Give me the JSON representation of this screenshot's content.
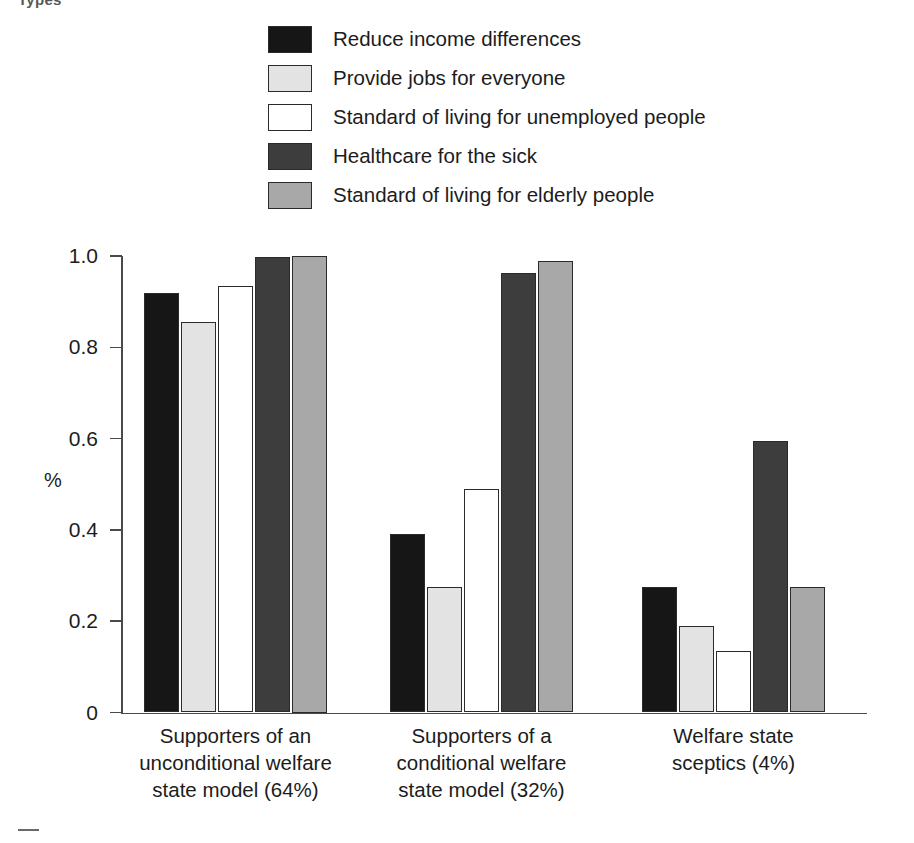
{
  "figure": {
    "top_cropped_text": "Types",
    "y_axis_title": "%",
    "footer_rule": "horizontal-rule"
  },
  "legend": {
    "position": "top-center",
    "items": [
      {
        "label": "Reduce income differences",
        "color": "#161616"
      },
      {
        "label": "Provide jobs for everyone",
        "color": "#e3e3e3"
      },
      {
        "label": "Standard of living for unemployed people",
        "color": "#ffffff"
      },
      {
        "label": "Healthcare for the sick",
        "color": "#3d3d3d"
      },
      {
        "label": "Standard of living for elderly people",
        "color": "#a8a8a8"
      }
    ]
  },
  "chart_data": {
    "type": "bar",
    "title": "",
    "subtitle": "",
    "xlabel": "",
    "ylabel": "%",
    "ylim": [
      0,
      1.0
    ],
    "yticks": [
      "0",
      "0.2",
      "0.4",
      "0.6",
      "0.8",
      "1.0"
    ],
    "ytick_values": [
      0,
      0.2,
      0.4,
      0.6,
      0.8,
      1.0
    ],
    "grid": false,
    "legend_position": "top-center",
    "categories": [
      "Supporters of an unconditional welfare state model (64%)",
      "Supporters of a conditional welfare state model (32%)",
      "Welfare state sceptics (4%)"
    ],
    "category_lines": [
      [
        "Supporters of an",
        "unconditional welfare",
        "state model (64%)"
      ],
      [
        "Supporters of a",
        "conditional welfare",
        "state model (32%)"
      ],
      [
        "Welfare state",
        "sceptics (4%)"
      ]
    ],
    "series": [
      {
        "name": "Reduce income differences",
        "color": "#161616",
        "values": [
          0.92,
          0.39,
          0.275
        ]
      },
      {
        "name": "Provide jobs for everyone",
        "color": "#e3e3e3",
        "values": [
          0.855,
          0.275,
          0.19
        ]
      },
      {
        "name": "Standard of living for unemployed people",
        "color": "#ffffff",
        "values": [
          0.935,
          0.49,
          0.135
        ]
      },
      {
        "name": "Healthcare for the sick",
        "color": "#3d3d3d",
        "values": [
          0.998,
          0.963,
          0.595
        ]
      },
      {
        "name": "Standard of living for elderly people",
        "color": "#a8a8a8",
        "values": [
          1.0,
          0.99,
          0.275
        ]
      }
    ]
  },
  "geometry": {
    "plot_left": 121,
    "plot_right": 867,
    "baseline_y": 712.5,
    "top_y": 256,
    "bar_width": 35,
    "bar_gap": 2,
    "group_starts": [
      144,
      390,
      642
    ]
  }
}
